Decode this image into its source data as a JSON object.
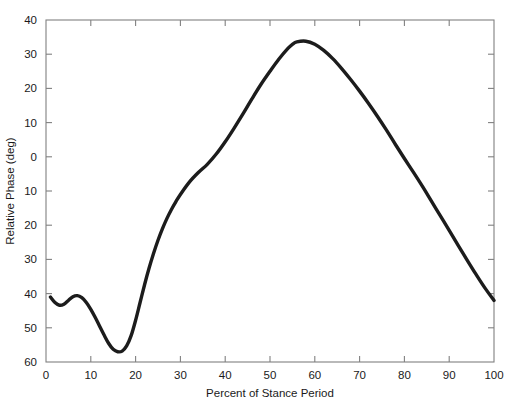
{
  "chart_data": {
    "type": "line",
    "title": "",
    "xlabel": "Percent of Stance Period",
    "ylabel": "Relative Phase (deg)",
    "xlim": [
      0,
      100
    ],
    "ylim": [
      -60,
      40
    ],
    "xticks": [
      0,
      10,
      20,
      30,
      40,
      50,
      60,
      70,
      80,
      90,
      100
    ],
    "yticks": [
      40,
      30,
      20,
      10,
      0,
      -10,
      -20,
      -30,
      -40,
      -50,
      -60
    ],
    "xtick_labels": [
      "0",
      "10",
      "20",
      "30",
      "40",
      "50",
      "60",
      "70",
      "80",
      "90",
      "100"
    ],
    "ytick_labels": [
      "40",
      "30",
      "20",
      "10",
      "0",
      "10",
      "20",
      "30",
      "40",
      "50",
      "60"
    ],
    "grid": false,
    "legend": null,
    "series": [
      {
        "name": "Relative Phase",
        "color": "#1c1c1c",
        "line_width": 3.4,
        "x": [
          1.0,
          2.0,
          3.0,
          4.0,
          5.0,
          6.0,
          7.0,
          8.0,
          9.0,
          10.0,
          11.0,
          12.0,
          13.0,
          14.0,
          15.0,
          16.0,
          17.0,
          18.0,
          19.0,
          20.0,
          21.0,
          22.0,
          23.0,
          24.0,
          25.0,
          26.0,
          27.0,
          28.0,
          29.0,
          30.0,
          32.0,
          34.0,
          36.0,
          38.0,
          40.0,
          42.0,
          44.0,
          46.0,
          48.0,
          50.0,
          52.0,
          54.0,
          55.0,
          56.0,
          58.0,
          60.0,
          62.0,
          64.0,
          66.0,
          68.0,
          70.0,
          72.0,
          74.0,
          76.0,
          78.0,
          80.0,
          82.0,
          84.0,
          86.0,
          88.0,
          90.0,
          92.0,
          94.0,
          96.0,
          98.0,
          100.0
        ],
        "y": [
          -41.0,
          -42.6,
          -43.4,
          -43.1,
          -42.0,
          -40.9,
          -40.6,
          -41.2,
          -42.6,
          -44.6,
          -47.0,
          -49.6,
          -52.2,
          -54.6,
          -56.3,
          -57.0,
          -56.8,
          -55.3,
          -52.3,
          -47.8,
          -42.6,
          -37.4,
          -32.6,
          -28.3,
          -24.4,
          -21.0,
          -18.0,
          -15.4,
          -13.1,
          -11.0,
          -7.4,
          -4.6,
          -2.2,
          0.8,
          4.4,
          8.4,
          12.6,
          17.0,
          21.2,
          25.0,
          28.6,
          31.7,
          32.9,
          33.6,
          33.8,
          32.9,
          31.1,
          28.7,
          25.8,
          22.6,
          19.2,
          15.6,
          11.8,
          7.8,
          3.6,
          -0.5,
          -4.5,
          -8.6,
          -12.9,
          -17.2,
          -21.5,
          -25.9,
          -30.2,
          -34.4,
          -38.4,
          -42.0
        ]
      }
    ]
  },
  "figure": {
    "background_color": "#ffffff",
    "axis_color": "#808080",
    "text_color": "#1a1a1a"
  }
}
